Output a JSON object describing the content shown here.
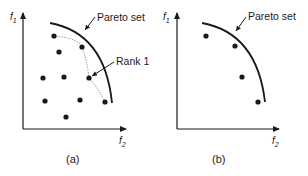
{
  "colors": {
    "ink": "#1a1a1a",
    "dotted": "#777777",
    "background": "#ffffff"
  },
  "panels": [
    {
      "caption": "(a)",
      "y_axis": {
        "label": "f",
        "subscript": "1"
      },
      "x_axis": {
        "label": "f",
        "subscript": "2"
      },
      "curve_label": "Pareto set",
      "rank_label": "Rank 1",
      "points": [
        [
          54,
          36
        ],
        [
          59,
          52
        ],
        [
          82,
          47
        ],
        [
          43,
          78
        ],
        [
          64,
          77
        ],
        [
          89,
          78
        ],
        [
          45,
          101
        ],
        [
          80,
          100
        ],
        [
          105,
          102
        ],
        [
          66,
          117
        ]
      ]
    },
    {
      "caption": "(b)",
      "y_axis": {
        "label": "f",
        "subscript": "1"
      },
      "x_axis": {
        "label": "f",
        "subscript": "2"
      },
      "curve_label": "Pareto set",
      "points": [
        [
          206,
          36
        ],
        [
          235,
          46
        ],
        [
          242,
          77
        ],
        [
          258,
          102
        ]
      ]
    }
  ]
}
